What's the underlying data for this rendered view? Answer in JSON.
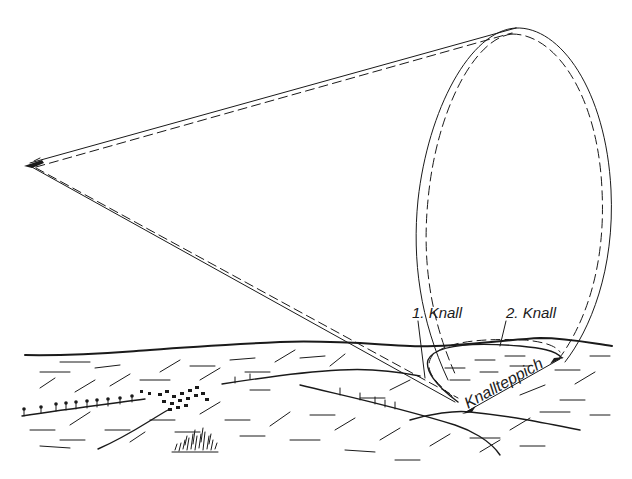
{
  "diagram": {
    "colors": {
      "ink": "#1a1a1a",
      "background": "#ffffff"
    },
    "labels": {
      "first_boom": "1. Knall",
      "second_boom": "2. Knall",
      "boom_carpet": "Knallteppich"
    },
    "elements": [
      {
        "id": "aircraft",
        "kind": "aircraft-icon",
        "position": [
          30,
          165
        ]
      },
      {
        "id": "cone",
        "kind": "shock-cone",
        "apex": [
          30,
          165
        ],
        "base_ellipse_center": [
          497,
          195
        ],
        "base_rx": 80,
        "base_ry": 168
      },
      {
        "id": "terrain",
        "kind": "hill-landscape"
      },
      {
        "id": "carpet",
        "kind": "boom-carpet-region"
      }
    ]
  }
}
